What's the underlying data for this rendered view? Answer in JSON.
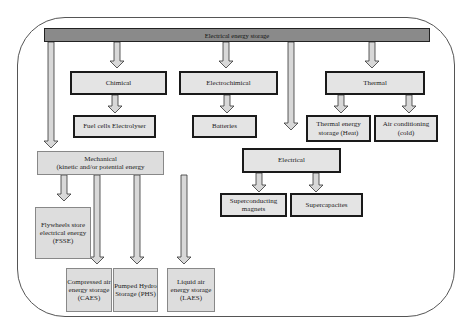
{
  "title": "Electrical energy storage",
  "categories": {
    "chemical": {
      "label": "Chimical",
      "children": [
        "Fuel cells Electrolyser"
      ]
    },
    "electrochemical": {
      "label": "Electrochimical",
      "children": [
        "Batteries"
      ]
    },
    "thermal": {
      "label": "Thermal",
      "children": [
        "Thermal energy storage (Heat)",
        "Air conditioning (cold)"
      ]
    },
    "electrical": {
      "label": "Electrical",
      "children": [
        "Superconducting magnets",
        "Supercapacites"
      ]
    },
    "mechanical": {
      "label": "Mechanical",
      "sublabel": "(kinetic and/or potential energy",
      "children": [
        "Flywheels store electrical energy (FSSE)",
        "Compressed air energy storage (CAES)",
        "Pumped Hydro Storage (PHS)",
        "Liquid air energy storage (LAES)"
      ]
    }
  }
}
